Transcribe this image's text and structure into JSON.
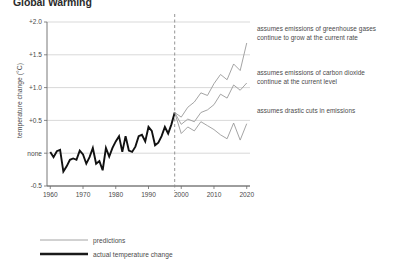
{
  "title": "Global Warming",
  "axis": {
    "ylabel": "temperature change (°C)",
    "y_ticks": [
      "+2.0",
      "+1.5",
      "+1.0",
      "+0.5",
      "none",
      "-0.5"
    ],
    "y_values": [
      2.0,
      1.5,
      1.0,
      0.5,
      0.0,
      -0.5
    ],
    "x_ticks": [
      "1960",
      "1970",
      "1980",
      "1990",
      "2000",
      "2010",
      "2020"
    ],
    "x_values": [
      1960,
      1970,
      1980,
      1990,
      2000,
      2010,
      2020
    ]
  },
  "legend": {
    "items": [
      {
        "label": "predictions",
        "color": "#9a9a9a",
        "width": 0.9
      },
      {
        "label": "actual temperature change",
        "color": "#1a1a1a",
        "width": 2.6
      }
    ]
  },
  "annotations": [
    "assumes emissions of greenhouse gases continue to grow at the current rate",
    "assumes emissions of  carbon dioxide continue at the current level",
    "assumes drastic cuts in emissions"
  ],
  "divider": {
    "x": 1998,
    "style": "dashed",
    "color": "#8a8a8a"
  },
  "chart_data": {
    "type": "line",
    "title": "Global Warming",
    "xlabel": "",
    "ylabel": "temperature change (°C)",
    "xlim": [
      1959,
      2021
    ],
    "ylim": [
      -0.5,
      2.0
    ],
    "grid": "horizontal",
    "legend_position": "bottom-left",
    "series": [
      {
        "name": "actual temperature change",
        "color": "#111111",
        "width": 1.9,
        "x": [
          1960,
          1961,
          1962,
          1963,
          1964,
          1965,
          1966,
          1967,
          1968,
          1969,
          1970,
          1971,
          1972,
          1973,
          1974,
          1975,
          1976,
          1977,
          1978,
          1979,
          1980,
          1981,
          1982,
          1983,
          1984,
          1985,
          1986,
          1987,
          1988,
          1989,
          1990,
          1991,
          1992,
          1993,
          1994,
          1995,
          1996,
          1997,
          1998
        ],
        "y": [
          0.02,
          -0.06,
          0.03,
          0.05,
          -0.28,
          -0.2,
          -0.1,
          -0.08,
          -0.1,
          0.04,
          -0.02,
          -0.16,
          -0.06,
          0.08,
          -0.16,
          -0.12,
          -0.26,
          0.08,
          -0.05,
          0.08,
          0.18,
          0.26,
          0.02,
          0.26,
          0.04,
          0.02,
          0.1,
          0.26,
          0.28,
          0.18,
          0.4,
          0.34,
          0.12,
          0.16,
          0.26,
          0.4,
          0.3,
          0.44,
          0.62
        ]
      },
      {
        "name": "high emissions prediction",
        "color": "#9a9a9a",
        "width": 0.9,
        "x": [
          1998,
          2000,
          2002,
          2004,
          2006,
          2008,
          2010,
          2012,
          2014,
          2016,
          2018,
          2020
        ],
        "y": [
          0.62,
          0.55,
          0.7,
          0.78,
          0.92,
          0.88,
          1.06,
          1.2,
          1.12,
          1.36,
          1.26,
          1.68
        ]
      },
      {
        "name": "constant emissions prediction",
        "color": "#9a9a9a",
        "width": 0.9,
        "x": [
          1998,
          2000,
          2002,
          2004,
          2006,
          2008,
          2010,
          2012,
          2014,
          2016,
          2018,
          2020
        ],
        "y": [
          0.62,
          0.44,
          0.52,
          0.48,
          0.62,
          0.66,
          0.74,
          0.9,
          0.84,
          1.04,
          0.96,
          1.07
        ]
      },
      {
        "name": "drastic cuts prediction",
        "color": "#9a9a9a",
        "width": 0.9,
        "x": [
          1998,
          2000,
          2002,
          2004,
          2006,
          2008,
          2010,
          2012,
          2014,
          2016,
          2018,
          2020
        ],
        "y": [
          0.62,
          0.3,
          0.4,
          0.34,
          0.48,
          0.42,
          0.36,
          0.28,
          0.22,
          0.46,
          0.2,
          0.45
        ]
      }
    ]
  }
}
